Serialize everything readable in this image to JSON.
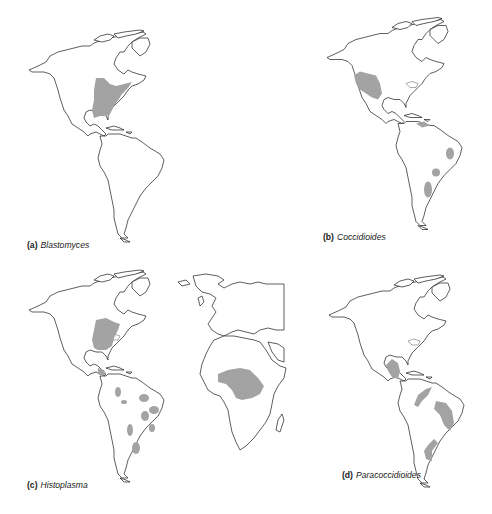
{
  "figure": {
    "shading_color": "#a3a3a3",
    "outline_color": "#1a1a1a",
    "panels": [
      {
        "letter": "(a)",
        "genus": "Blastomyces",
        "map": "americas",
        "endemic_regions": [
          "eastern-central United States and southern Canada (Mississippi/Ohio river valleys, Great Lakes)"
        ]
      },
      {
        "letter": "(b)",
        "genus": "Coccidioides",
        "map": "americas",
        "endemic_regions": [
          "southwestern United States and northern Mexico",
          "northern Venezuela coast",
          "northeastern Brazil",
          "central Argentina / Paraguay (two patches)"
        ]
      },
      {
        "letter": "(c)",
        "genus": "Histoplasma",
        "map": "americas-europe-africa",
        "endemic_regions": [
          "central-eastern United States",
          "Central America",
          "scattered patches across South America",
          "sub-Saharan central/western Africa"
        ]
      },
      {
        "letter": "(d)",
        "genus": "Paracoccidioides",
        "map": "americas",
        "endemic_regions": [
          "southern Mexico and Central America",
          "northern South America arc",
          "central Brazil",
          "southern Brazil / Paraguay / northern Argentina"
        ]
      }
    ]
  }
}
